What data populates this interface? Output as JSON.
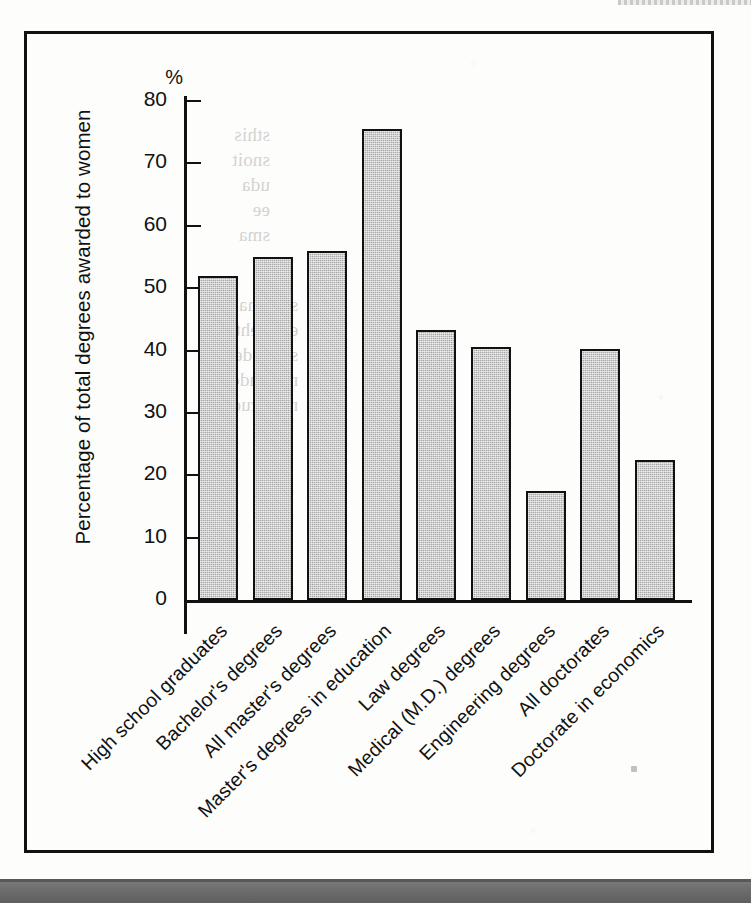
{
  "figure": {
    "percent_unit_label": "%",
    "y_axis_title": "Percentage of total degrees awarded to women",
    "frame_color": "#111111",
    "bar_fill_color": "#adadad",
    "bar_outline_color": "#111111"
  },
  "chart_data": {
    "type": "bar",
    "title": "",
    "xlabel": "",
    "ylabel": "Percentage of total degrees awarded to women",
    "unit": "%",
    "ylim": [
      0,
      83
    ],
    "yticks": [
      0,
      10,
      20,
      30,
      40,
      50,
      60,
      70,
      80
    ],
    "ytick_labels": [
      "0",
      "10",
      "20",
      "30",
      "40",
      "50",
      "60",
      "70",
      "80"
    ],
    "grid": false,
    "legend": null,
    "categories": [
      "High school graduates",
      "Bachelor's degrees",
      "All master's degrees",
      "Master's degrees in education",
      "Law degrees",
      "Medical (M.D.) degrees",
      "Engineering degrees",
      "All doctorates",
      "Doctorate in economics"
    ],
    "values": [
      52,
      55,
      56,
      75.5,
      43.3,
      40.5,
      17.5,
      40.3,
      22.5
    ]
  },
  "scan_artifacts": {
    "bleed_through_a": "sthis\nsnoit\nuda\nee\nsma",
    "bleed_through_b": "slaunna\nemit eht\nsraey de\nni ,eludom\nnoitacude"
  }
}
